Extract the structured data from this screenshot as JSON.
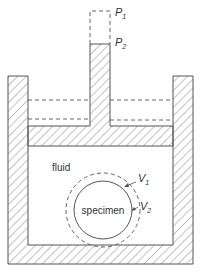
{
  "diagram": {
    "labels": {
      "p1": "P",
      "p1_sub": "1",
      "p2": "P",
      "p2_sub": "2",
      "fluid": "fluid",
      "specimen": "specimen",
      "v1": "V",
      "v1_sub": "1",
      "v2": "V",
      "v2_sub": "2"
    },
    "colors": {
      "stroke": "#555555",
      "hatch": "#777777",
      "background": "#ffffff"
    }
  }
}
